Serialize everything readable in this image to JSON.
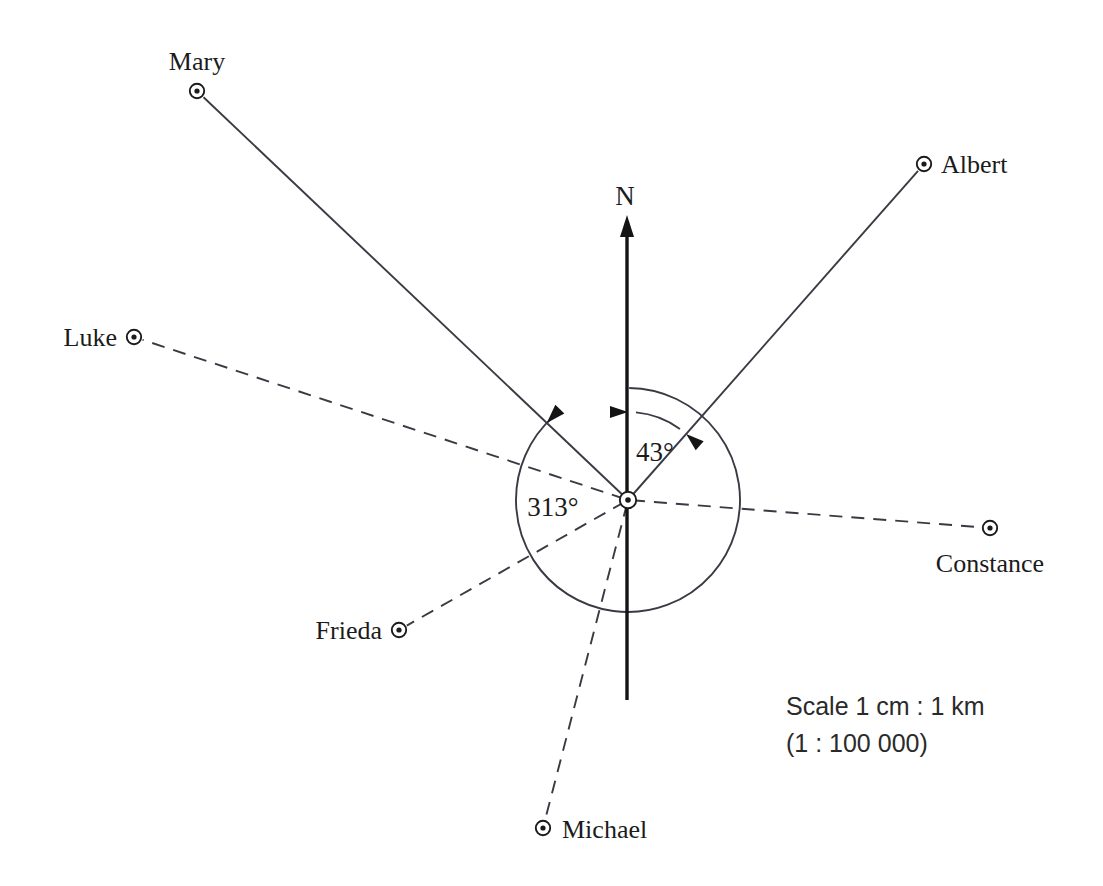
{
  "diagram": {
    "type": "bearing-compass-diagram",
    "center": {
      "x": 628,
      "y": 500,
      "name": "observation-point"
    },
    "north": {
      "label": "N",
      "label_x": 625,
      "label_y": 205,
      "axis_top_y": 215,
      "axis_bottom_y": 700,
      "axis_x": 627
    },
    "places": [
      {
        "name": "Mary",
        "x": 197,
        "y": 91,
        "line_style": "solid",
        "label_x": 197,
        "label_y": 70,
        "label_anchor": "middle"
      },
      {
        "name": "Albert",
        "x": 924,
        "y": 164,
        "line_style": "solid",
        "label_x": 941,
        "label_y": 173,
        "label_anchor": "start"
      },
      {
        "name": "Luke",
        "x": 134,
        "y": 337,
        "line_style": "dashed",
        "label_x": 117,
        "label_y": 346,
        "label_anchor": "end"
      },
      {
        "name": "Constance",
        "x": 990,
        "y": 528,
        "line_style": "dashed",
        "label_x": 990,
        "label_y": 572,
        "label_anchor": "middle"
      },
      {
        "name": "Frieda",
        "x": 399,
        "y": 630,
        "line_style": "dashed",
        "label_x": 382,
        "label_y": 639,
        "label_anchor": "end"
      },
      {
        "name": "Michael",
        "x": 543,
        "y": 828,
        "line_style": "dashed",
        "label_x": 562,
        "label_y": 838,
        "label_anchor": "start"
      }
    ],
    "angles": [
      {
        "value": "43°",
        "degrees": 43,
        "label_x": 655,
        "label_y": 461,
        "from": "N",
        "to": "Albert",
        "arc_radius": 88,
        "arrows": "both"
      },
      {
        "value": "313°",
        "degrees": 313,
        "label_x": 553,
        "label_y": 516,
        "from": "N",
        "to": "Mary",
        "arc_radius": 112,
        "arrows": "end"
      }
    ],
    "scale": {
      "line1": "Scale 1 cm : 1 km",
      "line2": "(1 : 100 000)",
      "x": 786,
      "y1": 715,
      "y2": 752
    },
    "colors": {
      "ink": "#1b1b1b",
      "line": "#3a3a44",
      "axis": "#141414",
      "background": "#ffffff"
    }
  }
}
